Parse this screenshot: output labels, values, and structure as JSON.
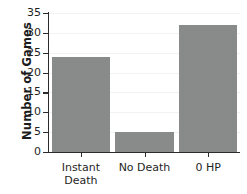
{
  "chart_data": {
    "type": "bar",
    "title": "",
    "subtitle": "",
    "xlabel": "",
    "ylabel": "Number of Games",
    "categories": [
      "Instant\nDeath",
      "No Death",
      "0 HP"
    ],
    "values": [
      24,
      5,
      32
    ],
    "ylim": [
      0,
      35
    ],
    "yticks": [
      0,
      5,
      10,
      15,
      20,
      25,
      30,
      35
    ],
    "ytick_labels": [
      "0",
      "5",
      "10",
      "15",
      "20",
      "25",
      "30",
      "35"
    ],
    "grid": true,
    "legend": null,
    "bar_color": "#898b8b",
    "axis_color": "#2b2b2b",
    "grid_color": "#f2f2f2",
    "background_color": "#ffffff"
  }
}
